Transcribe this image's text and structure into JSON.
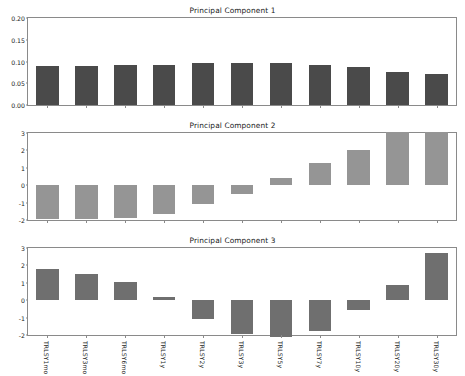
{
  "figure": {
    "background_color": "#ffffff",
    "axis_color": "#8a8a8a",
    "text_color": "#1a1a1a"
  },
  "chart_data": [
    {
      "type": "bar",
      "title": "Principal Component 1",
      "xlabel": "",
      "ylabel": "",
      "ylim": [
        0.0,
        0.2
      ],
      "yticks": [
        "0.00",
        "0.05",
        "0.10",
        "0.15",
        "0.20"
      ],
      "ytick_values": [
        0.0,
        0.05,
        0.1,
        0.15,
        0.2
      ],
      "grid": false,
      "legend": "none",
      "bar_color": "#4a4a4a",
      "categories": [
        "TRLSY1mo",
        "TRLSY3mo",
        "TRLSY6mo",
        "TRLSY1y",
        "TRLSY2y",
        "TRLSY3y",
        "TRLSY5y",
        "TRLSY7y",
        "TRLSY10y",
        "TRLSY20y",
        "TRLSY30y"
      ],
      "values": [
        0.09,
        0.09,
        0.091,
        0.093,
        0.096,
        0.097,
        0.096,
        0.093,
        0.088,
        0.077,
        0.072
      ]
    },
    {
      "type": "bar",
      "title": "Principal Component 2",
      "xlabel": "",
      "ylabel": "",
      "ylim": [
        -2.0,
        3.0
      ],
      "yticks": [
        "-2",
        "-1",
        "0",
        "1",
        "2",
        "3"
      ],
      "ytick_values": [
        -2,
        -1,
        0,
        1,
        2,
        3
      ],
      "grid": false,
      "legend": "none",
      "bar_color": "#959595",
      "categories": [
        "TRLSY1mo",
        "TRLSY3mo",
        "TRLSY6mo",
        "TRLSY1y",
        "TRLSY2y",
        "TRLSY3y",
        "TRLSY5y",
        "TRLSY7y",
        "TRLSY10y",
        "TRLSY20y",
        "TRLSY30y"
      ],
      "values": [
        -1.92,
        -1.92,
        -1.9,
        -1.66,
        -1.1,
        -0.5,
        0.42,
        1.3,
        2.03,
        3.05,
        3.08
      ]
    },
    {
      "type": "bar",
      "title": "Principal Component 3",
      "xlabel": "",
      "ylabel": "",
      "ylim": [
        -2.0,
        3.0
      ],
      "yticks": [
        "-2",
        "-1",
        "0",
        "1",
        "2",
        "3"
      ],
      "ytick_values": [
        -2,
        -1,
        0,
        1,
        2,
        3
      ],
      "grid": false,
      "legend": "none",
      "bar_color": "#6f6f6f",
      "categories": [
        "TRLSY1mo",
        "TRLSY3mo",
        "TRLSY6mo",
        "TRLSY1y",
        "TRLSY2y",
        "TRLSY3y",
        "TRLSY5y",
        "TRLSY7y",
        "TRLSY10y",
        "TRLSY20y",
        "TRLSY30y"
      ],
      "values": [
        1.82,
        1.52,
        1.05,
        0.18,
        -1.1,
        -1.95,
        -2.12,
        -1.78,
        -0.58,
        0.85,
        2.72
      ]
    }
  ],
  "x_axis_labels": [
    "TRLSY1mo",
    "TRLSY3mo",
    "TRLSY6mo",
    "TRLSY1y",
    "TRLSY2y",
    "TRLSY3y",
    "TRLSY5y",
    "TRLSY7y",
    "TRLSY10y",
    "TRLSY20y",
    "TRLSY30y"
  ]
}
